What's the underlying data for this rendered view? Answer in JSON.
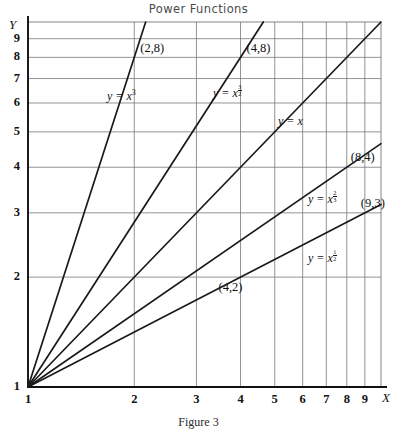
{
  "chart_title": "Power Functions",
  "top_artifact": "",
  "figure_caption": "Figure 3",
  "axes": {
    "y_name": "Y",
    "x_name": "X",
    "x_ticks": [
      "1",
      "2",
      "3",
      "4",
      "5",
      "6",
      "7",
      "8",
      "9"
    ],
    "y_ticks": [
      "1",
      "2",
      "3",
      "4",
      "5",
      "6",
      "7",
      "8",
      "9"
    ],
    "grid": "on",
    "scale": "log-log"
  },
  "style": {
    "curve_color": "#1a1a1a",
    "grid_color": "#777777",
    "axis_color": "#111111",
    "background": "#ffffff"
  },
  "point_labels": [
    {
      "id": "p-2-8",
      "text": "(2,8)"
    },
    {
      "id": "p-4-8",
      "text": "(4,8)"
    },
    {
      "id": "p-8-4",
      "text": "(8,4)"
    },
    {
      "id": "p-9-3",
      "text": "(9,3)"
    },
    {
      "id": "p-4-2",
      "text": "(4,2)"
    }
  ],
  "curve_labels": {
    "cube": {
      "lhs": "y = x",
      "exp": "3"
    },
    "three_halves": {
      "lhs": "y = x",
      "num": "3",
      "den": "2"
    },
    "linear": {
      "lhs": "y = x",
      "exp": ""
    },
    "two_thirds": {
      "lhs": "y = x",
      "num": "2",
      "den": "3"
    },
    "one_half": {
      "lhs": "y = x",
      "num": "1",
      "den": "2"
    }
  },
  "chart_data": {
    "type": "line",
    "title": "Power Functions",
    "xlabel": "X",
    "ylabel": "Y",
    "xscale": "log",
    "yscale": "log",
    "xlim": [
      1,
      10
    ],
    "ylim": [
      1,
      10
    ],
    "grid": true,
    "legend": "inline-curve-labels",
    "xticks": [
      1,
      2,
      3,
      4,
      5,
      6,
      7,
      8,
      9
    ],
    "yticks": [
      1,
      2,
      3,
      4,
      5,
      6,
      7,
      8,
      9
    ],
    "series": [
      {
        "name": "y = x^3",
        "exponent": 3,
        "x": [
          1,
          1.2,
          1.5,
          2,
          2.154
        ],
        "y": [
          1,
          1.728,
          3.375,
          8,
          10
        ],
        "marked_points": [
          [
            2,
            8
          ]
        ]
      },
      {
        "name": "y = x^(3/2)",
        "exponent": 1.5,
        "x": [
          1,
          2,
          3,
          4,
          4.642
        ],
        "y": [
          1,
          2.828,
          5.196,
          8,
          10
        ],
        "marked_points": [
          [
            4,
            8
          ]
        ]
      },
      {
        "name": "y = x",
        "exponent": 1,
        "x": [
          1,
          2,
          4,
          6,
          8,
          10
        ],
        "y": [
          1,
          2,
          4,
          6,
          8,
          10
        ],
        "marked_points": []
      },
      {
        "name": "y = x^(2/3)",
        "exponent": 0.6667,
        "x": [
          1,
          2,
          4,
          8,
          10
        ],
        "y": [
          1,
          1.587,
          2.52,
          4,
          4.642
        ],
        "marked_points": [
          [
            8,
            4
          ]
        ]
      },
      {
        "name": "y = x^(1/2)",
        "exponent": 0.5,
        "x": [
          1,
          2,
          4,
          9,
          10
        ],
        "y": [
          1,
          1.414,
          2,
          3,
          3.162
        ],
        "marked_points": [
          [
            9,
            3
          ],
          [
            4,
            2
          ]
        ]
      }
    ],
    "annotations": [
      {
        "text": "(2,8)",
        "x": 2,
        "y": 8
      },
      {
        "text": "(4,8)",
        "x": 4,
        "y": 8
      },
      {
        "text": "(8,4)",
        "x": 8,
        "y": 4
      },
      {
        "text": "(9,3)",
        "x": 9,
        "y": 3
      },
      {
        "text": "(4,2)",
        "x": 4,
        "y": 2
      }
    ]
  }
}
